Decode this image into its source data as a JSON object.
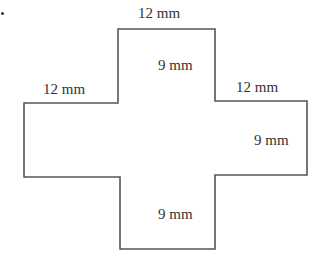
{
  "diagram": {
    "shape": "plus-shaped cross polygon",
    "stroke_color": "#555555",
    "labels": {
      "top": "12 mm",
      "inner_top": "9 mm",
      "left_arm_top": "12 mm",
      "right_arm_top": "12 mm",
      "right_arm_side": "9 mm",
      "bottom_arm": "9 mm"
    }
  }
}
